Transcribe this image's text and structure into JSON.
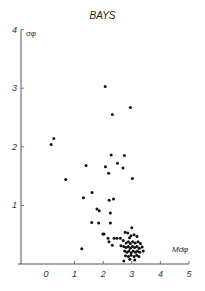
{
  "chart_data": {
    "type": "scatter",
    "title": "BAYS",
    "xlabel": "Mdφ",
    "ylabel": "σφ",
    "xlim": [
      -1,
      5
    ],
    "ylim": [
      0,
      4
    ],
    "x_ticks": [
      "0",
      "1",
      "2",
      "3",
      "4",
      "5"
    ],
    "y_ticks": [
      "1",
      "2",
      "3",
      "4"
    ],
    "grid": false,
    "legend": null,
    "points": [
      [
        2.07,
        3.03
      ],
      [
        2.95,
        2.67
      ],
      [
        2.32,
        2.55
      ],
      [
        0.27,
        2.14
      ],
      [
        0.18,
        2.04
      ],
      [
        1.4,
        1.68
      ],
      [
        0.69,
        1.44
      ],
      [
        2.28,
        1.86
      ],
      [
        2.74,
        1.85
      ],
      [
        2.5,
        1.72
      ],
      [
        2.08,
        1.66
      ],
      [
        2.69,
        1.64
      ],
      [
        2.19,
        1.55
      ],
      [
        3.02,
        1.46
      ],
      [
        1.31,
        1.13
      ],
      [
        1.61,
        1.22
      ],
      [
        2.21,
        1.09
      ],
      [
        2.36,
        1.11
      ],
      [
        1.78,
        0.94
      ],
      [
        1.86,
        0.91
      ],
      [
        2.25,
        0.87
      ],
      [
        1.6,
        0.71
      ],
      [
        1.84,
        0.7
      ],
      [
        2.25,
        0.7
      ],
      [
        1.99,
        0.51
      ],
      [
        2.77,
        0.54
      ],
      [
        1.25,
        0.26
      ],
      [
        2.03,
        0.51
      ],
      [
        2.17,
        0.44
      ],
      [
        2.2,
        0.38
      ],
      [
        2.38,
        0.44
      ],
      [
        2.48,
        0.44
      ],
      [
        2.6,
        0.44
      ],
      [
        2.32,
        0.32
      ],
      [
        2.62,
        0.31
      ],
      [
        2.86,
        0.53
      ],
      [
        2.97,
        0.48
      ],
      [
        3.08,
        0.5
      ],
      [
        3.0,
        0.62
      ],
      [
        2.92,
        0.45
      ],
      [
        3.18,
        0.47
      ],
      [
        2.7,
        0.4
      ],
      [
        2.8,
        0.36
      ],
      [
        2.88,
        0.38
      ],
      [
        2.95,
        0.35
      ],
      [
        3.03,
        0.38
      ],
      [
        3.12,
        0.36
      ],
      [
        3.22,
        0.38
      ],
      [
        3.3,
        0.35
      ],
      [
        2.72,
        0.3
      ],
      [
        2.8,
        0.28
      ],
      [
        2.88,
        0.3
      ],
      [
        2.95,
        0.27
      ],
      [
        3.02,
        0.3
      ],
      [
        3.1,
        0.28
      ],
      [
        3.18,
        0.3
      ],
      [
        3.26,
        0.27
      ],
      [
        3.36,
        0.29
      ],
      [
        2.75,
        0.22
      ],
      [
        2.83,
        0.2
      ],
      [
        2.9,
        0.22
      ],
      [
        2.98,
        0.19
      ],
      [
        3.05,
        0.22
      ],
      [
        3.13,
        0.2
      ],
      [
        3.2,
        0.22
      ],
      [
        3.28,
        0.2
      ],
      [
        3.4,
        0.22
      ],
      [
        2.78,
        0.14
      ],
      [
        2.88,
        0.13
      ],
      [
        2.97,
        0.15
      ],
      [
        3.08,
        0.13
      ],
      [
        3.17,
        0.15
      ],
      [
        3.25,
        0.13
      ],
      [
        2.72,
        0.05
      ],
      [
        2.93,
        0.08
      ],
      [
        3.1,
        0.07
      ]
    ]
  }
}
